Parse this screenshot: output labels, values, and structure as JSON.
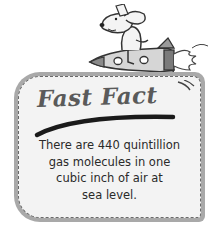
{
  "callout": {
    "title": "Fast Fact",
    "body_lines": [
      "There are 440 quintillion",
      "gas molecules in one",
      "cubic inch of air at",
      "sea level."
    ],
    "mascot": "dog-riding-rocket-icon"
  },
  "colors": {
    "card_border": "#a9a9a9",
    "card_fill": "#f3f3f3",
    "title": "#5a5a5a",
    "text": "#2a2a2a"
  }
}
